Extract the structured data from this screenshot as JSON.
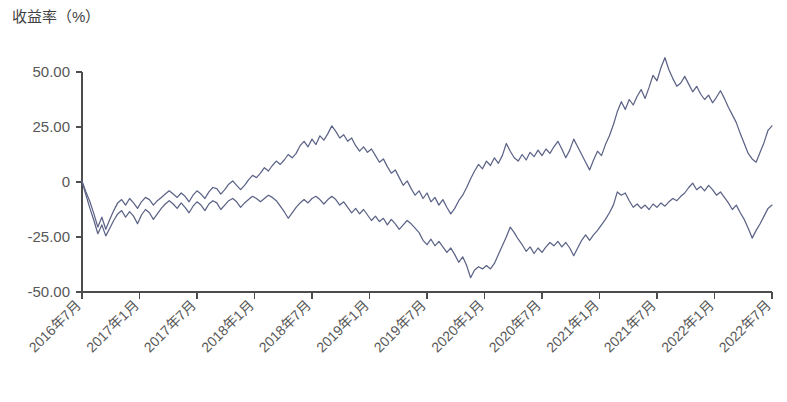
{
  "chart_data": {
    "type": "line",
    "title": "",
    "ylabel": "收益率（%）",
    "xlabel": "",
    "grid": false,
    "legend": "none",
    "ylim": [
      -50,
      50
    ],
    "ytick_labels": [
      "50.00",
      "25.00",
      "0",
      "-25.00",
      "-50.00"
    ],
    "ytick_values": [
      50,
      25,
      0,
      -25,
      -50
    ],
    "xtick_labels": [
      "2016年7月",
      "2017年1月",
      "2017年7月",
      "2018年1月",
      "2018年7月",
      "2019年1月",
      "2019年7月",
      "2020年1月",
      "2020年7月",
      "2021年1月",
      "2021年7月",
      "2022年1月",
      "2022年7月"
    ],
    "x_start_label": "2016年7月",
    "x_end_label": "2022年7月",
    "colors": {
      "series_1": "#5c6386",
      "series_2": "#5c6386",
      "axis": "#4d4d4d",
      "text": "#585858",
      "background": "#ffffff"
    },
    "x_index_range": [
      0,
      156
    ],
    "series": [
      {
        "name": "series-upper",
        "color": "#5c6386",
        "values": [
          0.4,
          -4.5,
          -9.0,
          -14.5,
          -20.5,
          -16.0,
          -21.5,
          -17.0,
          -13.0,
          -9.5,
          -8.0,
          -10.5,
          -7.5,
          -9.5,
          -12.0,
          -9.0,
          -7.0,
          -8.0,
          -10.5,
          -8.5,
          -7.0,
          -5.5,
          -4.0,
          -5.5,
          -7.0,
          -5.0,
          -6.5,
          -9.0,
          -6.0,
          -4.0,
          -5.5,
          -7.5,
          -4.5,
          -2.5,
          -3.0,
          -5.5,
          -3.5,
          -1.0,
          0.5,
          -1.5,
          -3.5,
          -1.5,
          1.0,
          3.0,
          2.0,
          4.0,
          6.5,
          5.0,
          7.5,
          9.5,
          8.0,
          10.0,
          12.5,
          11.0,
          13.0,
          16.5,
          18.5,
          16.0,
          19.5,
          17.0,
          21.0,
          19.0,
          22.0,
          25.5,
          23.0,
          20.0,
          21.5,
          18.5,
          20.0,
          16.5,
          14.0,
          16.0,
          13.5,
          15.0,
          12.0,
          9.0,
          10.5,
          7.0,
          4.0,
          5.5,
          2.0,
          -1.5,
          0.5,
          -3.0,
          -6.0,
          -4.0,
          -7.5,
          -5.0,
          -9.0,
          -7.0,
          -10.5,
          -8.0,
          -11.5,
          -14.5,
          -12.0,
          -8.5,
          -6.0,
          -2.5,
          1.5,
          5.0,
          8.0,
          6.0,
          9.5,
          7.5,
          11.0,
          8.5,
          12.0,
          17.5,
          14.0,
          11.0,
          9.5,
          12.5,
          10.0,
          13.5,
          11.5,
          14.5,
          12.0,
          15.0,
          13.0,
          16.0,
          18.5,
          15.0,
          11.0,
          14.5,
          19.5,
          16.0,
          12.5,
          9.0,
          5.5,
          10.0,
          14.0,
          12.0,
          17.0,
          21.0,
          26.0,
          32.0,
          36.5,
          33.0,
          37.5,
          35.0,
          39.0,
          42.0,
          38.0,
          43.0,
          48.5,
          46.0,
          52.0,
          56.5,
          51.0,
          47.0,
          43.5,
          45.0,
          48.0,
          44.5,
          41.0,
          43.5,
          40.0,
          37.5,
          39.5,
          36.0,
          38.5,
          41.5,
          38.0,
          34.0,
          30.5,
          27.0,
          22.0,
          17.5,
          13.0,
          10.5,
          9.0,
          13.5,
          18.0,
          23.5,
          25.5
        ]
      },
      {
        "name": "series-lower",
        "color": "#5c6386",
        "values": [
          0.2,
          -6.0,
          -12.0,
          -17.5,
          -23.5,
          -19.5,
          -24.5,
          -21.0,
          -17.5,
          -14.5,
          -13.0,
          -16.0,
          -13.5,
          -15.5,
          -19.0,
          -15.0,
          -12.5,
          -14.0,
          -17.0,
          -14.5,
          -12.0,
          -10.0,
          -8.5,
          -10.0,
          -12.0,
          -9.5,
          -11.5,
          -14.0,
          -11.0,
          -9.0,
          -10.5,
          -13.0,
          -10.0,
          -8.5,
          -9.5,
          -12.5,
          -10.5,
          -8.5,
          -7.5,
          -9.0,
          -11.5,
          -9.5,
          -8.0,
          -6.5,
          -7.5,
          -9.0,
          -7.5,
          -6.0,
          -7.0,
          -8.5,
          -11.0,
          -13.5,
          -16.5,
          -14.0,
          -11.5,
          -9.5,
          -8.0,
          -9.5,
          -7.5,
          -6.5,
          -8.0,
          -10.0,
          -8.0,
          -6.5,
          -8.0,
          -10.5,
          -9.0,
          -11.5,
          -14.0,
          -12.0,
          -14.5,
          -12.5,
          -15.0,
          -17.5,
          -15.5,
          -18.0,
          -16.5,
          -19.5,
          -17.0,
          -19.0,
          -21.5,
          -19.5,
          -17.5,
          -19.0,
          -21.0,
          -23.0,
          -26.5,
          -28.5,
          -26.0,
          -29.0,
          -27.0,
          -29.5,
          -32.0,
          -30.0,
          -33.0,
          -36.5,
          -34.0,
          -38.0,
          -43.5,
          -40.0,
          -38.5,
          -39.5,
          -38.0,
          -39.5,
          -37.0,
          -33.0,
          -29.0,
          -25.0,
          -20.5,
          -23.0,
          -26.0,
          -28.5,
          -31.5,
          -29.5,
          -32.5,
          -30.0,
          -32.0,
          -29.5,
          -27.5,
          -29.0,
          -27.0,
          -29.5,
          -27.5,
          -30.0,
          -33.5,
          -30.0,
          -26.5,
          -24.0,
          -26.5,
          -24.0,
          -22.0,
          -19.5,
          -17.0,
          -14.0,
          -10.5,
          -4.5,
          -6.0,
          -5.0,
          -8.5,
          -11.5,
          -10.0,
          -12.0,
          -10.5,
          -12.5,
          -10.0,
          -11.5,
          -9.5,
          -11.0,
          -9.0,
          -7.5,
          -8.5,
          -6.5,
          -5.0,
          -2.5,
          -0.5,
          -3.5,
          -2.0,
          -4.0,
          -1.5,
          -3.5,
          -6.0,
          -4.5,
          -7.0,
          -9.5,
          -12.5,
          -10.5,
          -14.0,
          -17.0,
          -21.0,
          -25.5,
          -22.0,
          -19.0,
          -15.5,
          -12.0,
          -10.5
        ]
      }
    ]
  }
}
